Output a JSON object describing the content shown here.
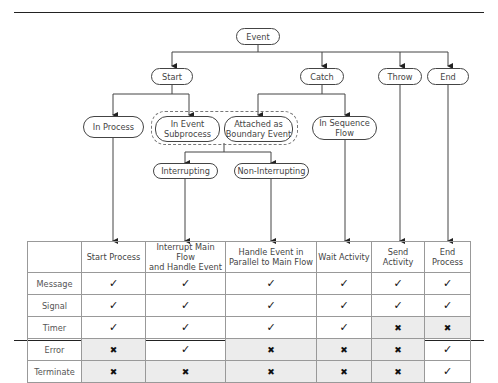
{
  "diagram": {
    "root": "Event",
    "level1": [
      "Start",
      "Catch",
      "Throw",
      "End"
    ],
    "start_children": [
      "In Process",
      "In Event\nSubprocess"
    ],
    "catch_children": [
      "Attached as\nBoundary Event",
      "In Sequence\nFlow"
    ],
    "boundary_children": [
      "Interrupting",
      "Non-Interrupting"
    ]
  },
  "table": {
    "columns": [
      "",
      "Start Process",
      "Interrupt Main Flow\nand Handle Event",
      "Handle Event in\nParallel to Main Flow",
      "Wait Activity",
      "Send Activity",
      "End\nProcess"
    ],
    "rows": [
      {
        "label": "Message",
        "cells": [
          "yes",
          "yes",
          "yes",
          "yes",
          "yes",
          "yes"
        ]
      },
      {
        "label": "Signal",
        "cells": [
          "yes",
          "yes",
          "yes",
          "yes",
          "yes",
          "yes"
        ]
      },
      {
        "label": "Timer",
        "cells": [
          "yes",
          "yes",
          "yes",
          "yes",
          "no",
          "no"
        ]
      },
      {
        "label": "Error",
        "cells": [
          "no",
          "yes",
          "no",
          "no",
          "no",
          "yes"
        ]
      },
      {
        "label": "Terminate",
        "cells": [
          "no",
          "no",
          "no",
          "no",
          "no",
          "yes"
        ]
      }
    ],
    "symbols": {
      "yes": "✓",
      "no": "✖"
    },
    "shade_color": "#ececec"
  }
}
